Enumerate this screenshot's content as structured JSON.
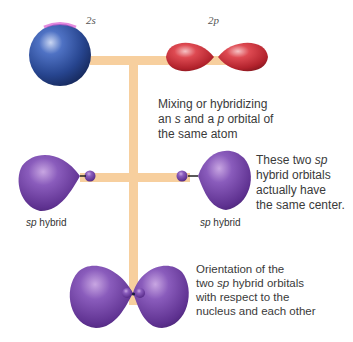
{
  "diagram": {
    "orbital_labels": {
      "s": "2s",
      "p": "2p"
    },
    "captions": {
      "mixing": [
        "Mixing or hybridizing",
        "an ",
        "s",
        " and a ",
        "p",
        " orbital of",
        "the same atom"
      ],
      "mixing_line1": "Mixing or hybridizing",
      "mixing_line2_a": "an ",
      "mixing_line2_s": "s",
      "mixing_line2_b": " and a ",
      "mixing_line2_p": "p",
      "mixing_line2_c": " orbital of",
      "mixing_line3": "the same atom",
      "center_line1_a": "These two ",
      "center_line1_sp": "sp",
      "center_line2": "hybrid orbitals",
      "center_line3": "actually have",
      "center_line4": "the same center.",
      "orient_line1": "Orientation of the",
      "orient_line2_a": "two ",
      "orient_line2_sp": "sp",
      "orient_line2_b": " hybrid orbitals",
      "orient_line3": "with respect to the",
      "orient_line4": "nucleus and each other"
    },
    "hybrid_labels": {
      "left_sp": "sp",
      "left_text": " hybrid",
      "right_sp": "sp",
      "right_text": " hybrid"
    },
    "colors": {
      "connector": "#f7cf9e",
      "s_orbital": "#2a4a9a",
      "p_orbital": "#c8323c",
      "sp_orbital": "#6a3a96"
    }
  }
}
